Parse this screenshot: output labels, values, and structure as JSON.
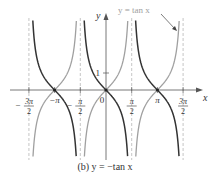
{
  "chart_data": {
    "type": "line",
    "title": "",
    "caption": "(b) y = −tan x",
    "xlabel": "x",
    "ylabel": "y",
    "xlim": [
      -5.2,
      5.5
    ],
    "ylim": [
      -4.0,
      4.2
    ],
    "grid": false,
    "x_ticks": [
      {
        "value": -4.712,
        "num": "3π",
        "den": "2",
        "sign": "−"
      },
      {
        "value": -3.1416,
        "label": "−π"
      },
      {
        "value": -1.5708,
        "num": "π",
        "den": "2",
        "sign": "−"
      },
      {
        "value": 0,
        "label": "0"
      },
      {
        "value": 1.5708,
        "num": "π",
        "den": "2",
        "sign": ""
      },
      {
        "value": 3.1416,
        "label": "π"
      },
      {
        "value": 4.712,
        "num": "3π",
        "den": "2",
        "sign": ""
      }
    ],
    "y_ticks": [
      {
        "value": 1,
        "label": "1"
      }
    ],
    "asymptotes_x": [
      -4.712,
      -1.5708,
      1.5708,
      4.712
    ],
    "series": [
      {
        "name": "y = −tan x",
        "function": "-tan(x)",
        "color": "#333333",
        "style": "solid",
        "emphasis": "primary"
      },
      {
        "name": "y = tan x",
        "function": "tan(x)",
        "color": "#a0a0a0",
        "style": "solid",
        "emphasis": "secondary"
      }
    ],
    "annotations": [
      {
        "text": "y = tan x",
        "color": "#a0a0a0",
        "arrow_to": "tan x branch near x = 3π/2"
      }
    ],
    "intersection_points": [
      {
        "x": -3.1416,
        "y": 0
      },
      {
        "x": 0,
        "y": 0
      },
      {
        "x": 3.1416,
        "y": 0
      }
    ]
  },
  "labels": {
    "x_axis": "x",
    "y_axis": "y",
    "y_tick_1": "1",
    "annotation": "y = tan x",
    "caption": "(b) y = −tan x"
  },
  "colors": {
    "primary_curve": "#333333",
    "secondary_curve": "#a0a0a0",
    "asymptote": "#b8b8b8",
    "axis": "#555555"
  }
}
